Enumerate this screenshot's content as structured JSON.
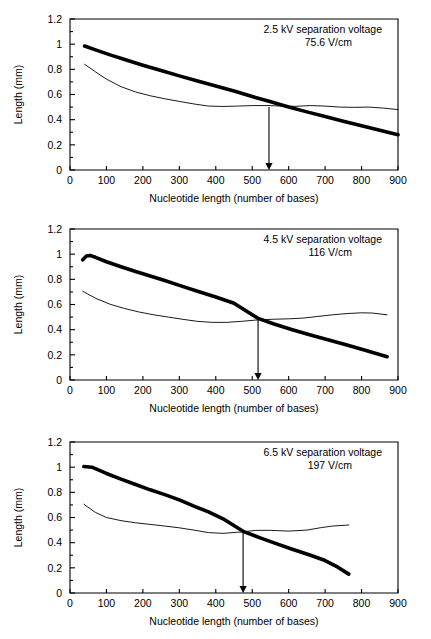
{
  "figure": {
    "name": "nucleotide-length-vs-separation-length",
    "panel_count": 3
  },
  "chart_data": [
    {
      "type": "line",
      "panel_index": 0,
      "title": "",
      "annotation_line1": "2.5 kV  separation voltage",
      "annotation_line2": "75.6 V/cm",
      "xlabel": "Nucleotide length (number of bases)",
      "ylabel": "Length (mm)",
      "xlim": [
        0,
        900
      ],
      "ylim": [
        0,
        1.2
      ],
      "xticks": [
        0,
        100,
        200,
        300,
        400,
        500,
        600,
        700,
        800,
        900
      ],
      "yticks": [
        0,
        0.2,
        0.4,
        0.6,
        0.8,
        1,
        1.2
      ],
      "xtick_labels": [
        "0",
        "100",
        "200",
        "300",
        "400",
        "500",
        "600",
        "700",
        "800",
        "900"
      ],
      "ytick_labels": [
        "0",
        "0.2",
        "0.4",
        "0.6",
        "0.8",
        "1",
        "1.2"
      ],
      "grid": false,
      "legend": "none",
      "annotation_marker": {
        "type": "vertical-arrow",
        "x": 546,
        "y_top": 0.5,
        "y_bottom": 0.0,
        "label": "546"
      },
      "series": [
        {
          "name": "thick-descending-curve",
          "style": "thick",
          "x": [
            40,
            70,
            110,
            150,
            200,
            250,
            300,
            350,
            400,
            450,
            500,
            546,
            600,
            650,
            700,
            750,
            800,
            850,
            900
          ],
          "y": [
            0.985,
            0.955,
            0.915,
            0.878,
            0.833,
            0.79,
            0.748,
            0.707,
            0.668,
            0.628,
            0.584,
            0.546,
            0.5,
            0.462,
            0.425,
            0.388,
            0.352,
            0.315,
            0.28
          ]
        },
        {
          "name": "thin-plateau-curve",
          "style": "thin",
          "x": [
            40,
            70,
            100,
            140,
            180,
            220,
            260,
            300,
            340,
            380,
            420,
            460,
            500,
            546,
            580,
            620,
            660,
            700,
            740,
            780,
            820,
            860,
            900
          ],
          "y": [
            0.84,
            0.78,
            0.722,
            0.662,
            0.62,
            0.59,
            0.566,
            0.545,
            0.525,
            0.508,
            0.505,
            0.508,
            0.512,
            0.512,
            0.508,
            0.506,
            0.512,
            0.508,
            0.5,
            0.498,
            0.5,
            0.492,
            0.48
          ]
        }
      ]
    },
    {
      "type": "line",
      "panel_index": 1,
      "title": "",
      "annotation_line1": "4.5 kV separation voltage",
      "annotation_line2": "116 V/cm",
      "xlabel": "Nucleotide length (number of bases)",
      "ylabel": "Length (mm)",
      "xlim": [
        0,
        900
      ],
      "ylim": [
        0,
        1.2
      ],
      "xticks": [
        0,
        100,
        200,
        300,
        400,
        500,
        600,
        700,
        800,
        900
      ],
      "yticks": [
        0,
        0.2,
        0.4,
        0.6,
        0.8,
        1,
        1.2
      ],
      "xtick_labels": [
        "0",
        "100",
        "200",
        "300",
        "400",
        "500",
        "600",
        "700",
        "800",
        "900"
      ],
      "ytick_labels": [
        "0",
        "0.2",
        "0.4",
        "0.6",
        "0.8",
        "1",
        "1.2"
      ],
      "grid": false,
      "legend": "none",
      "annotation_marker": {
        "type": "vertical-arrow",
        "x": 516,
        "y_top": 0.49,
        "y_bottom": 0.0,
        "label": "516"
      },
      "series": [
        {
          "name": "thick-descending-curve",
          "style": "thick",
          "x": [
            35,
            45,
            55,
            70,
            100,
            140,
            180,
            220,
            260,
            300,
            350,
            400,
            450,
            516,
            560,
            610,
            660,
            710,
            760,
            810,
            870
          ],
          "y": [
            0.955,
            0.985,
            0.99,
            0.975,
            0.94,
            0.9,
            0.862,
            0.826,
            0.79,
            0.752,
            0.706,
            0.66,
            0.61,
            0.49,
            0.445,
            0.4,
            0.358,
            0.318,
            0.278,
            0.236,
            0.185
          ]
        },
        {
          "name": "thin-plateau-curve",
          "style": "thin",
          "x": [
            35,
            70,
            110,
            150,
            190,
            230,
            270,
            310,
            350,
            390,
            430,
            470,
            516,
            560,
            600,
            640,
            680,
            720,
            760,
            800,
            830,
            870
          ],
          "y": [
            0.705,
            0.65,
            0.602,
            0.568,
            0.54,
            0.518,
            0.5,
            0.482,
            0.466,
            0.458,
            0.458,
            0.466,
            0.478,
            0.483,
            0.486,
            0.492,
            0.505,
            0.518,
            0.528,
            0.534,
            0.532,
            0.518
          ]
        }
      ]
    },
    {
      "type": "line",
      "panel_index": 2,
      "title": "",
      "annotation_line1": "6.5 kV separation voltage",
      "annotation_line2": "197 V/cm",
      "xlabel": "Nucleotide length (number of bases)",
      "ylabel": "Length (mm)",
      "xlim": [
        0,
        900
      ],
      "ylim": [
        0,
        1.2
      ],
      "xticks": [
        0,
        100,
        200,
        300,
        400,
        500,
        600,
        700,
        800,
        900
      ],
      "yticks": [
        0,
        0.2,
        0.4,
        0.6,
        0.8,
        1,
        1.2
      ],
      "xtick_labels": [
        "0",
        "100",
        "200",
        "300",
        "400",
        "500",
        "600",
        "700",
        "800",
        "900"
      ],
      "ytick_labels": [
        "0",
        "0.2",
        "0.4",
        "0.6",
        "0.8",
        "1",
        "1.2"
      ],
      "grid": false,
      "legend": "none",
      "annotation_marker": {
        "type": "vertical-arrow",
        "x": 475,
        "y_top": 0.49,
        "y_bottom": 0.0,
        "label": "475"
      },
      "series": [
        {
          "name": "thick-descending-curve",
          "style": "thick",
          "x": [
            38,
            60,
            100,
            140,
            180,
            220,
            260,
            300,
            340,
            380,
            420,
            475,
            520,
            560,
            610,
            660,
            700,
            735,
            765
          ],
          "y": [
            1.005,
            1.0,
            0.95,
            0.905,
            0.862,
            0.82,
            0.782,
            0.74,
            0.69,
            0.645,
            0.59,
            0.49,
            0.44,
            0.398,
            0.348,
            0.3,
            0.258,
            0.205,
            0.15
          ]
        },
        {
          "name": "thin-plateau-curve",
          "style": "thin",
          "x": [
            38,
            70,
            100,
            140,
            180,
            220,
            260,
            300,
            340,
            380,
            420,
            475,
            510,
            550,
            600,
            650,
            690,
            720,
            765
          ],
          "y": [
            0.705,
            0.64,
            0.6,
            0.575,
            0.558,
            0.545,
            0.532,
            0.518,
            0.5,
            0.48,
            0.474,
            0.486,
            0.498,
            0.498,
            0.492,
            0.5,
            0.52,
            0.532,
            0.54
          ]
        }
      ]
    }
  ]
}
